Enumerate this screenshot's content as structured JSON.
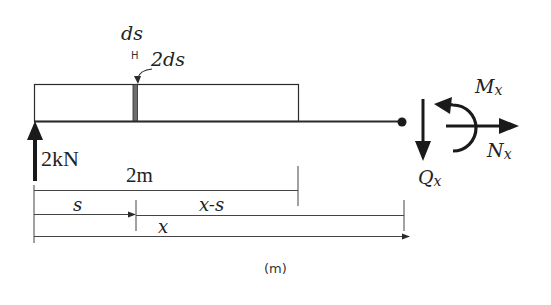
{
  "diagram": {
    "labels": {
      "element_width": "ds",
      "element_marker": "H",
      "shaded_element": "2ds",
      "reaction_force": "2kN",
      "span_length": "2m",
      "distance_s": "s",
      "distance_x_minus_s": "x-s",
      "distance_x": "x",
      "unit": "(m)",
      "moment": "M",
      "moment_sub": "x",
      "normal_force": "N",
      "normal_force_sub": "x",
      "shear_force": "Q",
      "shear_force_sub": "x"
    },
    "colors": {
      "line": "#2a2a2a",
      "shaded_strip": "#6e6e6e",
      "background": "#ffffff"
    }
  }
}
